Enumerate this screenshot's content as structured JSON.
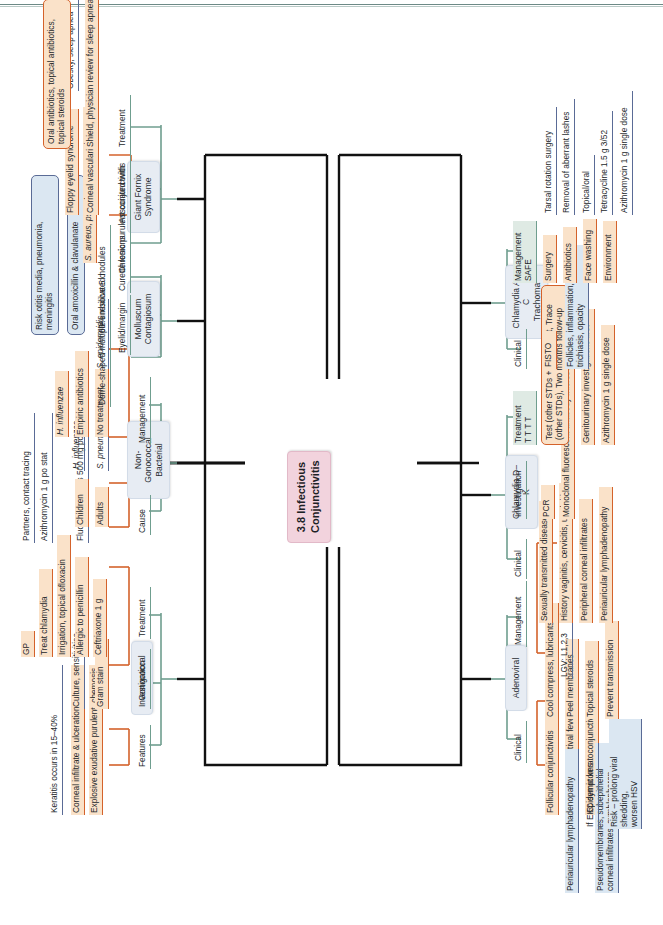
{
  "document": {
    "root": "3.8 Infectious\nConjunctivitis",
    "accents": {
      "root_fill": "#f2d3dd",
      "category_fill": "#e7ecf3",
      "level2_line": "#6f9e8f",
      "level3_line": "#d4622b",
      "level3_fill": "#fae2c9",
      "level4_line": "#5a6b96",
      "level4_fill": "#dbe7f2",
      "trunk": "#111111"
    }
  },
  "branches": {
    "gonococcal": {
      "title": "Gonococcal",
      "features_label": "Features",
      "features": [
        "Explosive exudative purulent, chemosis",
        "Corneal infiltrate & ulceration"
      ],
      "keratitis": "Keratitis occurs in 15–40%",
      "investigation_label": "Investigation",
      "investigation": "Gram stain",
      "culture": "Culture, sensitivities",
      "treatment_label": "Treatment",
      "treatment": [
        "Ceftriaxone 1 g",
        "Allergic to penicillin",
        "Irrigation, topical ofloxacin",
        "Treat chlamydia",
        "GP"
      ],
      "fluoroquinolones": "Fluoroquinolones 500 mg po 5/7",
      "azithromycin": "Azithromycin 1 g po stat",
      "partners": "Partners, contact tracing"
    },
    "nongonococcal": {
      "title": "Non-Gonococcal\nBacterial",
      "cause_label": "Cause",
      "cause": [
        "Adults",
        "Children"
      ],
      "adults_organisms": "S. pneumoniae, S. aureus, S. epidermidis",
      "children_organisms": "H. influenzae",
      "management_label": "Management",
      "management": [
        "No treatment",
        "Empiric antibiotics",
        "H. influenzae"
      ],
      "resolve": "60% resolve 5 d",
      "oral": "Oral amoxicillin & clavulanate",
      "risk": "Risk otitis media, pneumonia,\nmeningitis"
    },
    "molluscum": {
      "title": "Molluscum\nContagiosum",
      "nodules": "Dome-shaped multiple umbilicated nodules",
      "eyelid": "Eyelid/margin",
      "curette": "Curette lesions"
    },
    "giant_fornix": {
      "title": "Giant Fornix\nSyndrome",
      "chronic": "Chronic purulent conjunctivitis",
      "organisms": "S. aureus, pseudomonas aeruginosa",
      "associated_label": "Associated with",
      "associated": [
        "Corneal vascularization",
        "Floppy eyelid syndrome"
      ],
      "obesity": "Obesity, sleep apnea",
      "treatment_label": "Treatment",
      "treatment": [
        "Shield, physician review for sleep apnea",
        "Oral antibiotics, topical antibiotics,\ntopical steroids"
      ]
    },
    "adenoviral": {
      "title": "Adenoviral",
      "clinical_label": "Clinical",
      "clinical": [
        "Follicular conjunctivitis",
        "Pharyngoconjunctival fever",
        "Epidemic keratoconjunctivitis"
      ],
      "periauricular": "Periauricular lymphadenopathy",
      "pseudomembranes": "Pseudomembranes, subepithelial\ncorneal infiltrates, symblepharon",
      "management_label": "Management",
      "management": [
        "Cool compress, lubricants",
        "Peel membranes",
        "Topical steroids",
        "Prevent transmission"
      ],
      "if_ekc": "If EKC symptoms",
      "risk_hsv": "Risk – prolong viral shedding,\nworsen HSV"
    },
    "chlamydia_dk": {
      "title": "Chlamydia D–K",
      "clinical_label": "Clinical",
      "clinical": [
        "Sexually transmitted disease",
        "History vaginitis, cervicitis, urethritis",
        "Peripheral corneal infiltrates",
        "Periauricular lymphadenopathy"
      ],
      "lgv": "LGV: L1,2,3",
      "investigation_label": "Investigation",
      "investigation": [
        "PCR",
        "Monoclonal fluorescent antibody microscopy"
      ],
      "treatment_label": "Treatment\nT T T T",
      "treatment_note": "Test (other STDs + GU), Treat, Trace\n(other STDs), Two months follow-up",
      "treatment": [
        "Genitourinary investigations first",
        "Azithromycin 1 g single dose"
      ]
    },
    "trachoma": {
      "title": "Chlamydia A–C\nTrachoma",
      "clinical_label": "Clinical",
      "clinical_key": "FISTO",
      "clinical_detail": "Follicles, inflammation, scarring,\ntrichiasis, opacity",
      "management_label": "Management\nSAFE",
      "management": [
        "Surgery",
        "Antibiotics",
        "Face washing",
        "Environment"
      ],
      "surgery_items": [
        "Tarsal rotation surgery",
        "Removal of aberrant lashes"
      ],
      "antibiotic_items": [
        "Topical/oral",
        "Tetracycline 1.5 g 3/52",
        "Azithromycin 1 g single dose"
      ]
    }
  }
}
